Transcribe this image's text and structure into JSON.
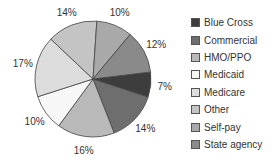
{
  "chart_data": {
    "type": "pie",
    "title": "",
    "start": "clockwise from about 3 o'clock with Blue Cross",
    "legend_position": "right",
    "slices": [
      {
        "label": "Blue Cross",
        "value": 7,
        "value_label": "7%",
        "color": "#3d3d3d"
      },
      {
        "label": "Commercial",
        "value": 14,
        "value_label": "14%",
        "color": "#6e6e6e"
      },
      {
        "label": "HMO/PPO",
        "value": 16,
        "value_label": "16%",
        "color": "#b9b9b9"
      },
      {
        "label": "Medicaid",
        "value": 10,
        "value_label": "10%",
        "color": "#f7f7f7"
      },
      {
        "label": "Medicare",
        "value": 17,
        "value_label": "17%",
        "color": "#dcdcdc"
      },
      {
        "label": "Other",
        "value": 14,
        "value_label": "14%",
        "color": "#c4c4c4"
      },
      {
        "label": "Self-pay",
        "value": 10,
        "value_label": "10%",
        "color": "#a9a9a9"
      },
      {
        "label": "State agency",
        "value": 12,
        "value_label": "12%",
        "color": "#8a8a8a"
      }
    ]
  }
}
